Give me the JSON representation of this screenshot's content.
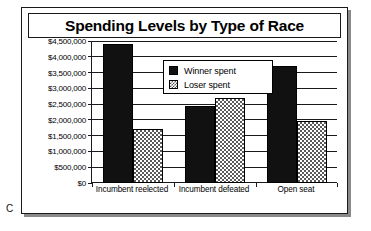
{
  "caption": {
    "letter": "C"
  },
  "chart": {
    "title": "Spending Levels by Type of Race"
  },
  "legend": {
    "items": [
      {
        "label": "Winner spent",
        "swatch": "solid-black-swatch",
        "color": "#111111"
      },
      {
        "label": "Loser spent",
        "swatch": "dotted-gray-swatch",
        "color": "#5a5a5a"
      }
    ]
  },
  "axis": {
    "y_ticks": [
      "$0",
      "$500,000",
      "$1,000,000",
      "$1,500,000",
      "$2,000,000",
      "$2,500,000",
      "$3,000,000",
      "$3,500,000",
      "$4,000,000",
      "$4,500,000"
    ],
    "x_categories": [
      "Incumbent reelected",
      "Incumbent defeated",
      "Open seat"
    ]
  },
  "chart_data": {
    "type": "bar",
    "title": "Spending Levels by Type of Race",
    "xlabel": "",
    "ylabel": "",
    "categories": [
      "Incumbent reelected",
      "Incumbent defeated",
      "Open seat"
    ],
    "series": [
      {
        "name": "Winner spent",
        "values": [
          4400000,
          2450000,
          3700000
        ],
        "color": "#111111"
      },
      {
        "name": "Loser spent",
        "values": [
          1700000,
          2700000,
          1950000
        ],
        "color": "#5a5a5a"
      }
    ],
    "ylim": [
      0,
      4500000
    ],
    "ytick_step": 500000,
    "ytick_labels": [
      "$0",
      "$500,000",
      "$1,000,000",
      "$1,500,000",
      "$2,000,000",
      "$2,500,000",
      "$3,000,000",
      "$3,500,000",
      "$4,000,000",
      "$4,500,000"
    ],
    "grid": true,
    "grid_axis": "y",
    "legend_position": "inside-upper-center",
    "bar_group_gap": true
  }
}
